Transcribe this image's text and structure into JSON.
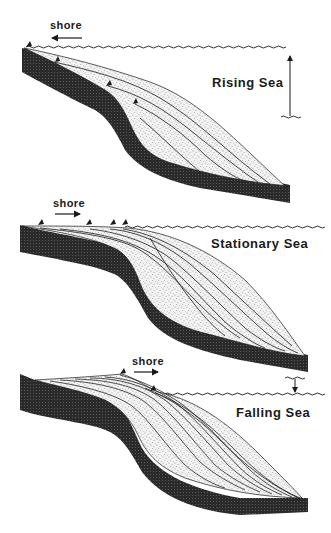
{
  "figure": {
    "panels": [
      {
        "id": "rising",
        "title": "Rising Sea",
        "shore_label": "shore",
        "shore_direction": "left",
        "sea_level_change": "up"
      },
      {
        "id": "stationary",
        "title": "Stationary Sea",
        "shore_label": "shore",
        "shore_direction": "right",
        "sea_level_change": "none"
      },
      {
        "id": "falling",
        "title": "Falling Sea",
        "shore_label": "shore",
        "shore_direction": "right",
        "sea_level_change": "down"
      }
    ],
    "colors": {
      "background": "#ffffff",
      "basement": "#262626",
      "sediment": "#efefef",
      "stipple": "#555555",
      "lines": "#1a1a1a"
    }
  }
}
